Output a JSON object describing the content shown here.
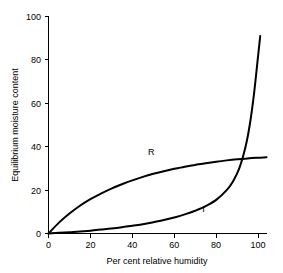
{
  "chart_data": {
    "type": "line",
    "title": "",
    "xlabel": "Per cent relative humidity",
    "ylabel": "Equilibrium moisture content",
    "xlim": [
      0,
      104
    ],
    "ylim": [
      0,
      100
    ],
    "xticks": [
      0,
      20,
      40,
      60,
      80,
      100
    ],
    "xtick_labels": [
      "0",
      "20",
      "40",
      "60",
      "80",
      "100"
    ],
    "yticks": [
      0,
      20,
      40,
      60,
      80,
      100
    ],
    "ytick_labels": [
      "0",
      "20",
      "40",
      "60",
      "80",
      "100"
    ],
    "grid": false,
    "legend": "inline-curve-labels",
    "series": [
      {
        "name": "R",
        "label": "R",
        "label_x": 49,
        "label_y": 36,
        "color": "#000000",
        "x": [
          0,
          5,
          10,
          15,
          20,
          25,
          30,
          35,
          40,
          45,
          50,
          55,
          60,
          65,
          70,
          75,
          80,
          85,
          90,
          95,
          100,
          104
        ],
        "y": [
          0,
          5.0,
          9.2,
          12.8,
          15.8,
          18.4,
          20.7,
          22.7,
          24.5,
          26.1,
          27.5,
          28.7,
          29.8,
          30.8,
          31.6,
          32.4,
          33.1,
          33.7,
          34.2,
          34.6,
          34.9,
          35.1
        ]
      },
      {
        "name": "I",
        "label": "I",
        "label_x": 74,
        "label_y": 10,
        "color": "#000000",
        "x": [
          0,
          5,
          10,
          15,
          20,
          25,
          30,
          35,
          40,
          45,
          50,
          55,
          60,
          65,
          70,
          75,
          80,
          85,
          88,
          91,
          94,
          96,
          98,
          100,
          101
        ],
        "y": [
          0,
          0.3,
          0.6,
          0.9,
          1.3,
          1.8,
          2.3,
          2.9,
          3.6,
          4.3,
          5.2,
          6.2,
          7.4,
          8.8,
          10.5,
          12.6,
          15.5,
          20.0,
          24.0,
          30.0,
          40.0,
          50.0,
          64.0,
          82.0,
          91.0
        ]
      }
    ]
  },
  "axes": {
    "x_axis_name": "x-axis",
    "y_axis_name": "y-axis"
  }
}
